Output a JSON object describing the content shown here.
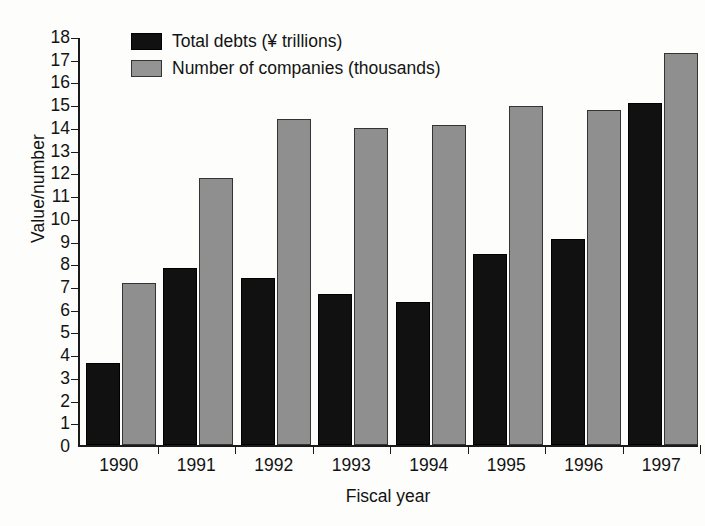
{
  "chart_data": {
    "type": "bar",
    "title": "",
    "xlabel": "Fiscal year",
    "ylabel": "Value/number",
    "categories": [
      "1990",
      "1991",
      "1992",
      "1993",
      "1994",
      "1995",
      "1996",
      "1997"
    ],
    "series": [
      {
        "name": "Total debts (¥ trillions)",
        "color": "#111111",
        "values": [
          3.6,
          7.8,
          7.35,
          6.65,
          6.3,
          8.4,
          9.05,
          15.05
        ]
      },
      {
        "name": "Number of companies (thousands)",
        "color": "#8f8f8f",
        "values": [
          7.15,
          11.75,
          14.35,
          13.95,
          14.1,
          14.9,
          14.75,
          17.25
        ]
      }
    ],
    "ylim": [
      0,
      18
    ],
    "ytick_labels": [
      "0",
      "1",
      "2",
      "3",
      "4",
      "5",
      "6",
      "7",
      "8",
      "9",
      "10",
      "11",
      "12",
      "13",
      "14",
      "15",
      "16",
      "17",
      "18"
    ],
    "yticks": [
      0,
      1,
      2,
      3,
      4,
      5,
      6,
      7,
      8,
      9,
      10,
      11,
      12,
      13,
      14,
      15,
      16,
      17,
      18
    ],
    "grid": false,
    "legend_position": "top-left"
  },
  "legend": {
    "entries": [
      {
        "label": "Total debts (¥ trillions)",
        "swatch": "black-square-swatch"
      },
      {
        "label": "Number of companies (thousands)",
        "swatch": "gray-square-swatch"
      }
    ]
  },
  "axes": {
    "y_title": "Value/number",
    "x_title": "Fiscal year"
  }
}
